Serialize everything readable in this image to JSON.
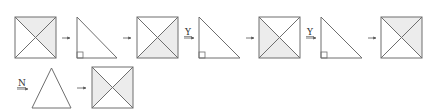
{
  "colors": {
    "stroke": "#6e6e6e",
    "shade": "#ececec",
    "background": "#ffffff",
    "text": "#333333"
  },
  "corner_mark": "",
  "row1": [
    {
      "type": "square",
      "shaded": [
        "top",
        "right"
      ]
    },
    {
      "type": "arrow",
      "label": ""
    },
    {
      "type": "right-triangle"
    },
    {
      "type": "arrow",
      "label": ""
    },
    {
      "type": "square",
      "shaded": [
        "right",
        "bottom"
      ]
    },
    {
      "type": "arrow",
      "label": "Y"
    },
    {
      "type": "right-triangle"
    },
    {
      "type": "arrow",
      "label": ""
    },
    {
      "type": "square",
      "shaded": [
        "left",
        "bottom"
      ]
    },
    {
      "type": "arrow",
      "label": "Y"
    },
    {
      "type": "right-triangle"
    },
    {
      "type": "arrow",
      "label": ""
    },
    {
      "type": "square",
      "shaded": [
        "top",
        "right"
      ]
    }
  ],
  "row2": [
    {
      "type": "arrow",
      "label": "N"
    },
    {
      "type": "isosceles-triangle"
    },
    {
      "type": "arrow",
      "label": ""
    },
    {
      "type": "square",
      "shaded": [
        "left",
        "right"
      ]
    }
  ],
  "labels": {
    "arrow_y_1": "Y",
    "arrow_y_2": "Y",
    "arrow_n": "N"
  }
}
